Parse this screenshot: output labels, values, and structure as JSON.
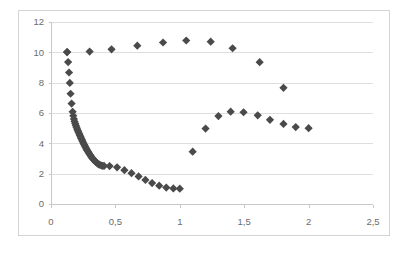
{
  "chart_data": {
    "type": "scatter",
    "title": "",
    "subtitle": "",
    "xlabel": "",
    "ylabel": "",
    "xlim": [
      0,
      2.5
    ],
    "ylim": [
      0,
      12
    ],
    "grid": true,
    "grid_axis": "y",
    "legend": "none",
    "decimal_separator": ",",
    "marker": {
      "shape": "diamond",
      "color": "#4a4a4a",
      "size": 5
    },
    "axis": {
      "x_ticks": [
        0,
        0.5,
        1,
        1.5,
        2,
        2.5
      ],
      "x_tick_labels": [
        "0",
        "0,5",
        "1",
        "1,5",
        "2",
        "2,5"
      ],
      "y_ticks": [
        0,
        2,
        4,
        6,
        8,
        10,
        12
      ],
      "y_tick_labels": [
        "0",
        "2",
        "4",
        "6",
        "8",
        "10",
        "12"
      ]
    },
    "series": [
      {
        "name": "descending-branch",
        "points": [
          [
            0.125,
            10.02
          ],
          [
            0.133,
            9.36
          ],
          [
            0.14,
            8.67
          ],
          [
            0.146,
            7.98
          ],
          [
            0.152,
            7.27
          ],
          [
            0.16,
            6.62
          ],
          [
            0.168,
            6.08
          ],
          [
            0.173,
            5.82
          ],
          [
            0.178,
            5.6
          ],
          [
            0.183,
            5.44
          ],
          [
            0.188,
            5.3
          ],
          [
            0.193,
            5.18
          ],
          [
            0.198,
            5.06
          ],
          [
            0.203,
            4.95
          ],
          [
            0.208,
            4.84
          ],
          [
            0.213,
            4.74
          ],
          [
            0.219,
            4.63
          ],
          [
            0.224,
            4.53
          ],
          [
            0.229,
            4.43
          ],
          [
            0.234,
            4.33
          ],
          [
            0.24,
            4.23
          ],
          [
            0.245,
            4.13
          ],
          [
            0.251,
            4.03
          ],
          [
            0.257,
            3.93
          ],
          [
            0.263,
            3.83
          ],
          [
            0.269,
            3.73
          ],
          [
            0.275,
            3.63
          ],
          [
            0.281,
            3.54
          ],
          [
            0.288,
            3.45
          ],
          [
            0.294,
            3.36
          ],
          [
            0.301,
            3.27
          ],
          [
            0.308,
            3.18
          ],
          [
            0.315,
            3.09
          ],
          [
            0.322,
            3.01
          ],
          [
            0.33,
            2.93
          ],
          [
            0.338,
            2.86
          ],
          [
            0.346,
            2.79
          ],
          [
            0.354,
            2.72
          ],
          [
            0.363,
            2.66
          ],
          [
            0.372,
            2.61
          ],
          [
            0.381,
            2.57
          ],
          [
            0.391,
            2.54
          ],
          [
            0.401,
            2.52
          ],
          [
            0.412,
            2.51
          ],
          [
            0.455,
            2.5
          ],
          [
            0.513,
            2.42
          ],
          [
            0.57,
            2.23
          ],
          [
            0.625,
            2.03
          ],
          [
            0.68,
            1.82
          ],
          [
            0.733,
            1.59
          ],
          [
            0.785,
            1.38
          ],
          [
            0.84,
            1.21
          ],
          [
            0.895,
            1.08
          ],
          [
            0.95,
            1.03
          ],
          [
            1.0,
            1.01
          ]
        ]
      },
      {
        "name": "upper-branch",
        "points": [
          [
            0.125,
            10.02
          ],
          [
            0.3,
            10.05
          ],
          [
            0.47,
            10.2
          ],
          [
            0.67,
            10.44
          ],
          [
            0.87,
            10.65
          ],
          [
            1.05,
            10.78
          ],
          [
            1.24,
            10.7
          ],
          [
            1.41,
            10.27
          ],
          [
            1.62,
            9.35
          ],
          [
            1.805,
            7.66
          ]
        ]
      },
      {
        "name": "lower-right-branch",
        "points": [
          [
            1.1,
            3.45
          ],
          [
            1.2,
            4.97
          ],
          [
            1.3,
            5.8
          ],
          [
            1.395,
            6.09
          ],
          [
            1.495,
            6.05
          ],
          [
            1.605,
            5.85
          ],
          [
            1.7,
            5.55
          ],
          [
            1.805,
            5.28
          ],
          [
            1.9,
            5.07
          ],
          [
            2.0,
            5.0
          ]
        ]
      }
    ]
  }
}
